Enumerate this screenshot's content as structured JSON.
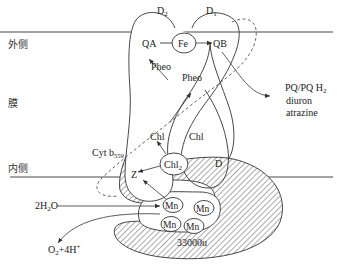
{
  "diagram": {
    "side_labels": {
      "outer": "外侧",
      "membrane": "膜",
      "inner": "内侧"
    },
    "subunits": {
      "d2": "D",
      "d2_sub": "2",
      "d1": "D",
      "d1_sub": "1",
      "d": "D"
    },
    "cofactors": {
      "qa": "QA",
      "fe": "Fe",
      "qb": "QB",
      "pheo_left": "Pheo",
      "pheo_right": "Pheo",
      "chl_left": "Chl",
      "chl_right": "Chl",
      "chl2": "Chl",
      "chl2_sub": "2",
      "z": "Z",
      "mn": [
        "Mn",
        "Mn",
        "Mn",
        "Mn"
      ]
    },
    "cyt": {
      "label": "Cyt b",
      "sub": "559"
    },
    "inhibitors": {
      "line1": "PQ/PQ H",
      "line1_sub": "2",
      "line2": "diuron",
      "line3": "atrazine"
    },
    "water": {
      "reactant": "2H",
      "reactant_sub": "2",
      "reactant_tail": "O",
      "product_o": "O",
      "product_sub": "2",
      "product_tail": "+4H",
      "product_sup": "+"
    },
    "protein_33k": "33000u"
  }
}
